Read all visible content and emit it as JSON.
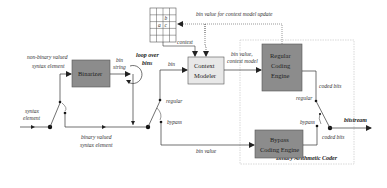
{
  "diagram": {
    "blocks": {
      "binarizer": {
        "label": "Binarizer",
        "fill": "#8c8c8c"
      },
      "context_modeler": {
        "label_line1": "Context",
        "label_line2": "Modeler",
        "fill": "#e8e8e8"
      },
      "regular_engine": {
        "label_line1": "Regular",
        "label_line2": "Coding",
        "label_line3": "Engine",
        "fill": "#8c8c8c"
      },
      "bypass_engine": {
        "label_line1": "Bypass",
        "label_line2": "Coding Engine",
        "fill": "#8c8c8c"
      },
      "bac_group": {
        "label": "Binary Arithmetic Coder"
      }
    },
    "context_grid": {
      "rows": 4,
      "cols": 4,
      "cell_b": "b",
      "cell_a": "a",
      "cell_c": "c"
    },
    "labels": {
      "syntax_element_1": "syntax",
      "syntax_element_2": "element",
      "non_binary_1": "non-binary valued",
      "non_binary_2": "syntax element",
      "bin_string_1": "bin",
      "bin_string_2": "string",
      "loop_1": "loop over",
      "loop_2": "bins",
      "bin": "bin",
      "context": "context",
      "bin_value_update": "bin value for context model update",
      "bin_value_context_1": "bin value,",
      "bin_value_context_2": "context model",
      "regular_left": "regular",
      "bypass_left": "bypass",
      "binary_valued_1": "binary valued",
      "binary_valued_2": "syntax element",
      "bin_value": "bin value",
      "coded_bits_top": "coded bits",
      "coded_bits_bottom": "coded bits",
      "regular_right": "regular",
      "bypass_right": "bypass",
      "bitstream": "bitstream"
    }
  }
}
